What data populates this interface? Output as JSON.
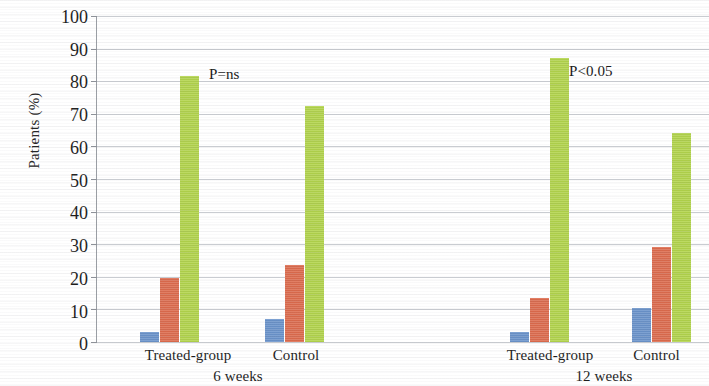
{
  "chart_data": {
    "type": "bar",
    "title": "",
    "xlabel": "",
    "ylabel": "Patients (%)",
    "ylim": [
      0,
      100
    ],
    "ytick_labels": [
      "100",
      "90",
      "80",
      "70",
      "60",
      "50",
      "40",
      "30",
      "20",
      "10",
      "0"
    ],
    "ytick_values": [
      100,
      90,
      80,
      70,
      60,
      50,
      40,
      30,
      20,
      10,
      0
    ],
    "grid": true,
    "legend": "none",
    "categories": [
      "Treated-group",
      "Control",
      "Treated-group",
      "Control"
    ],
    "group_labels": [
      "6 weeks",
      "12 weeks"
    ],
    "series": [
      {
        "name": "series-1",
        "color": "#6a93cb",
        "values": [
          3,
          7,
          3,
          10.5
        ]
      },
      {
        "name": "series-2",
        "color": "#dd6b4d",
        "values": [
          19.5,
          23.5,
          13.5,
          29
        ]
      },
      {
        "name": "series-3",
        "color": "#b2d44b",
        "values": [
          81.5,
          72.5,
          87,
          64
        ]
      }
    ],
    "annotations": [
      {
        "text": "P=ns",
        "near_group": 0
      },
      {
        "text": "P<0.05",
        "near_group": 2
      }
    ]
  },
  "axis": {
    "y_title": "Patients (%)"
  },
  "ticks": {
    "t0": "100",
    "t1": "90",
    "t2": "80",
    "t3": "70",
    "t4": "60",
    "t5": "50",
    "t6": "40",
    "t7": "30",
    "t8": "20",
    "t9": "10",
    "t10": "0"
  },
  "categories": {
    "c0": "Treated-group",
    "c1": "Control",
    "c2": "Treated-group",
    "c3": "Control"
  },
  "groups": {
    "g0": "6 weeks",
    "g1": "12 weeks"
  },
  "annotations": {
    "a0": "P=ns",
    "a1": "P<0.05"
  }
}
